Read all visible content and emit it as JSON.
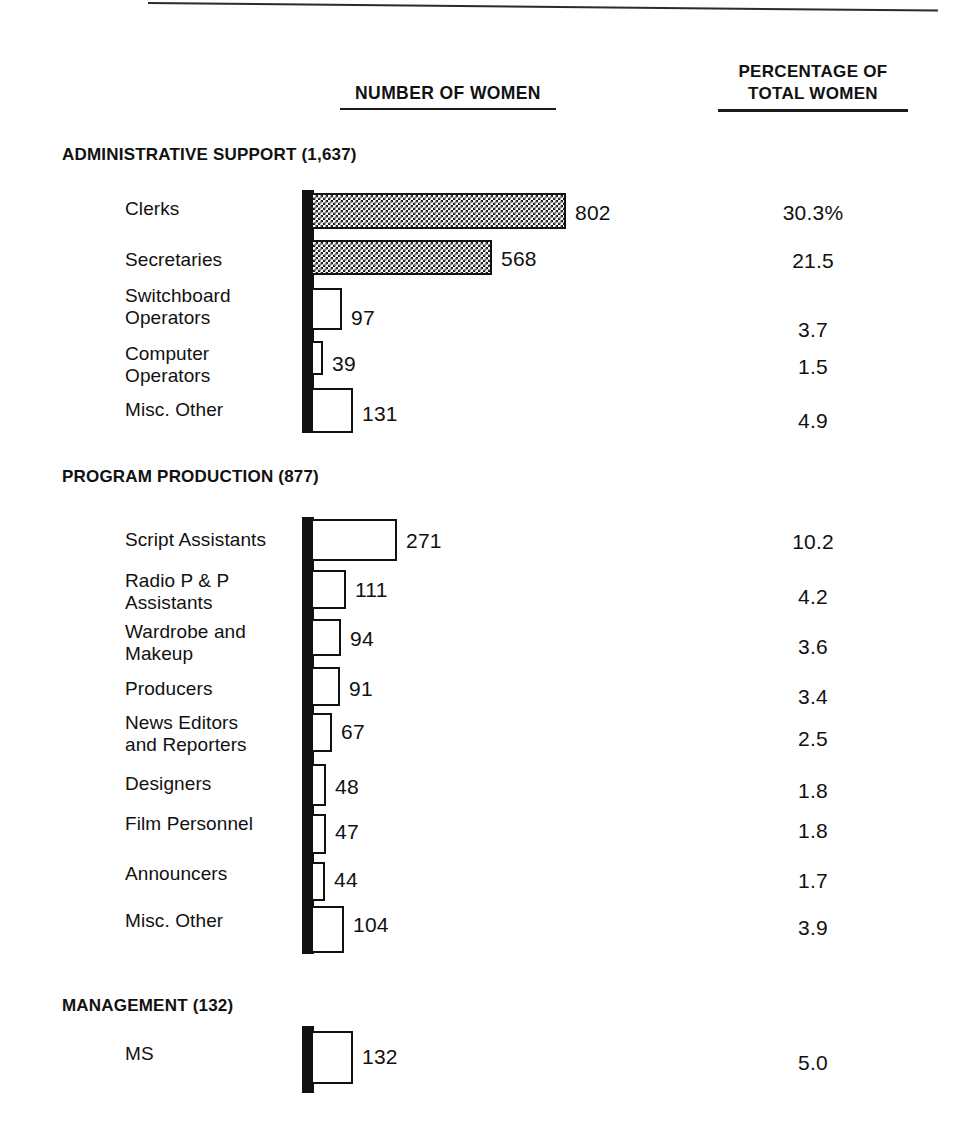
{
  "header": {
    "number_col": "NUMBER OF WOMEN",
    "pct_col_line1": "PERCENTAGE OF",
    "pct_col_line2": "TOTAL WOMEN"
  },
  "chart_data": {
    "type": "bar",
    "orientation": "horizontal",
    "title": "",
    "xlabel": "NUMBER OF WOMEN",
    "ylabel": "",
    "grid": false,
    "legend": null,
    "value_axis_range": [
      0,
      802
    ],
    "secondary_column": "PERCENTAGE OF TOTAL WOMEN",
    "sections": [
      {
        "name": "ADMINISTRATIVE SUPPORT",
        "total": "1,637",
        "heading": "ADMINISTRATIVE SUPPORT (1,637)",
        "rows": [
          {
            "label": "Clerks",
            "label_lines": [
              "Clerks"
            ],
            "value": 802,
            "value_text": "802",
            "pct": "30.3%",
            "hatched": true
          },
          {
            "label": "Secretaries",
            "label_lines": [
              "Secretaries"
            ],
            "value": 568,
            "value_text": "568",
            "pct": "21.5",
            "hatched": true
          },
          {
            "label": "Switchboard Operators",
            "label_lines": [
              "Switchboard",
              "Operators"
            ],
            "value": 97,
            "value_text": "97",
            "pct": "3.7",
            "hatched": false
          },
          {
            "label": "Computer Operators",
            "label_lines": [
              "Computer",
              "Operators"
            ],
            "value": 39,
            "value_text": "39",
            "pct": "1.5",
            "hatched": false
          },
          {
            "label": "Misc. Other",
            "label_lines": [
              "Misc. Other"
            ],
            "value": 131,
            "value_text": "131",
            "pct": "4.9",
            "hatched": false
          }
        ]
      },
      {
        "name": "PROGRAM PRODUCTION",
        "total": "877",
        "heading": "PROGRAM PRODUCTION (877)",
        "rows": [
          {
            "label": "Script Assistants",
            "label_lines": [
              "Script Assistants"
            ],
            "value": 271,
            "value_text": "271",
            "pct": "10.2",
            "hatched": false
          },
          {
            "label": "Radio P & P Assistants",
            "label_lines": [
              "Radio P & P",
              "Assistants"
            ],
            "value": 111,
            "value_text": "111",
            "pct": "4.2",
            "hatched": false
          },
          {
            "label": "Wardrobe and Makeup",
            "label_lines": [
              "Wardrobe and",
              "Makeup"
            ],
            "value": 94,
            "value_text": "94",
            "pct": "3.6",
            "hatched": false
          },
          {
            "label": "Producers",
            "label_lines": [
              "Producers"
            ],
            "value": 91,
            "value_text": "91",
            "pct": "3.4",
            "hatched": false
          },
          {
            "label": "News Editors and Reporters",
            "label_lines": [
              "News Editors",
              "and Reporters"
            ],
            "value": 67,
            "value_text": "67",
            "pct": "2.5",
            "hatched": false
          },
          {
            "label": "Designers",
            "label_lines": [
              "Designers"
            ],
            "value": 48,
            "value_text": "48",
            "pct": "1.8",
            "hatched": false
          },
          {
            "label": "Film Personnel",
            "label_lines": [
              "Film Personnel"
            ],
            "value": 47,
            "value_text": "47",
            "pct": "1.8",
            "hatched": false
          },
          {
            "label": "Announcers",
            "label_lines": [
              "Announcers"
            ],
            "value": 44,
            "value_text": "44",
            "pct": "1.7",
            "hatched": false
          },
          {
            "label": "Misc. Other",
            "label_lines": [
              "Misc. Other"
            ],
            "value": 104,
            "value_text": "104",
            "pct": "3.9",
            "hatched": false
          }
        ]
      },
      {
        "name": "MANAGEMENT",
        "total": "132",
        "heading": "MANAGEMENT (132)",
        "rows": [
          {
            "label": "MS",
            "label_lines": [
              "MS"
            ],
            "value": 132,
            "value_text": "132",
            "pct": "5.0",
            "hatched": false
          }
        ]
      }
    ]
  },
  "layout": {
    "axis_x": 302,
    "bar_origin_x": 311,
    "px_per_unit": 0.3185,
    "sections": [
      {
        "title_top": 145,
        "axis_top": 190,
        "axis_height": 243,
        "rows": [
          {
            "bar_top": 193,
            "bar_h": 36,
            "label_top": 197,
            "value_top": 201,
            "pct_top": 201
          },
          {
            "bar_top": 240,
            "bar_h": 35,
            "label_top": 248,
            "value_top": 247,
            "pct_top": 249
          },
          {
            "bar_top": 288,
            "bar_h": 42,
            "label_top": 285,
            "value_top": 306,
            "pct_top": 318
          },
          {
            "bar_top": 341,
            "bar_h": 34,
            "label_top": 343,
            "value_top": 352,
            "pct_top": 355
          },
          {
            "bar_top": 388,
            "bar_h": 45,
            "label_top": 398,
            "value_top": 402,
            "pct_top": 409
          }
        ]
      },
      {
        "title_top": 467,
        "axis_top": 517,
        "axis_height": 437,
        "rows": [
          {
            "bar_top": 519,
            "bar_h": 42,
            "label_top": 528,
            "value_top": 529,
            "pct_top": 530
          },
          {
            "bar_top": 570,
            "bar_h": 39,
            "label_top": 570,
            "value_top": 578,
            "pct_top": 585
          },
          {
            "bar_top": 619,
            "bar_h": 37,
            "label_top": 621,
            "value_top": 627,
            "pct_top": 635
          },
          {
            "bar_top": 667,
            "bar_h": 39,
            "label_top": 677,
            "value_top": 677,
            "pct_top": 685
          },
          {
            "bar_top": 713,
            "bar_h": 39,
            "label_top": 712,
            "value_top": 720,
            "pct_top": 727
          },
          {
            "bar_top": 764,
            "bar_h": 42,
            "label_top": 772,
            "value_top": 775,
            "pct_top": 779
          },
          {
            "bar_top": 814,
            "bar_h": 40,
            "label_top": 812,
            "value_top": 820,
            "pct_top": 819
          },
          {
            "bar_top": 862,
            "bar_h": 39,
            "label_top": 862,
            "value_top": 868,
            "pct_top": 869
          },
          {
            "bar_top": 906,
            "bar_h": 47,
            "label_top": 909,
            "value_top": 913,
            "pct_top": 916
          }
        ]
      },
      {
        "title_top": 996,
        "axis_top": 1026,
        "axis_height": 67,
        "rows": [
          {
            "bar_top": 1031,
            "bar_h": 53,
            "label_top": 1042,
            "value_top": 1045,
            "pct_top": 1051
          }
        ]
      }
    ]
  }
}
